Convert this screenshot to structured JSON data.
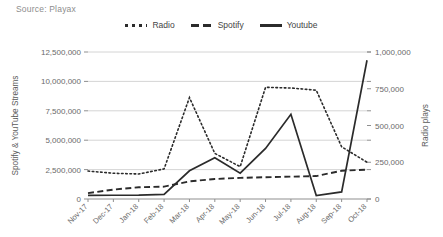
{
  "source_note": "Source: Playax",
  "legend": {
    "items": [
      {
        "label": "Radio",
        "style": "dotted",
        "color": "#2b2b2b",
        "icon": "dotted-line-swatch"
      },
      {
        "label": "Spotify",
        "style": "dashed",
        "color": "#2b2b2b",
        "icon": "dashed-line-swatch"
      },
      {
        "label": "Youtube",
        "style": "solid",
        "color": "#2b2b2b",
        "icon": "solid-line-swatch"
      }
    ]
  },
  "chart_data": {
    "type": "line",
    "title": "",
    "subtitle": "",
    "xlabel": "",
    "ylabel": "Spotify & YouTube Streams",
    "y2label": "Radio plays",
    "grid": true,
    "legend_position": "top-center",
    "categories": [
      "Nov-17",
      "Dec-17",
      "Jan-18",
      "Feb-18",
      "Mar-18",
      "Apr-18",
      "May-18",
      "Jun-18",
      "Jul-18",
      "Aug-18",
      "Sep-18",
      "Oct-18"
    ],
    "ylim": [
      0,
      12500000
    ],
    "yticks": [
      0,
      2500000,
      5000000,
      7500000,
      10000000,
      12500000
    ],
    "ytick_labels": [
      "0",
      "2,500,000",
      "5,000,000",
      "7,500,000",
      "10,000,000",
      "12,500,000"
    ],
    "y2lim": [
      0,
      1000000
    ],
    "y2ticks": [
      0,
      250000,
      500000,
      750000,
      1000000
    ],
    "y2tick_labels": [
      "0",
      "250,000",
      "500,000",
      "750,000",
      "1,000,000"
    ],
    "series": [
      {
        "name": "Radio",
        "axis": "right",
        "style": "dotted",
        "color": "#2b2b2b",
        "values": [
          190000,
          175000,
          170000,
          205000,
          690000,
          310000,
          220000,
          760000,
          755000,
          740000,
          355000,
          250000
        ]
      },
      {
        "name": "Spotify",
        "axis": "left",
        "style": "dashed",
        "color": "#2b2b2b",
        "values": [
          500000,
          800000,
          1000000,
          1050000,
          1500000,
          1700000,
          1800000,
          1850000,
          1900000,
          1950000,
          2400000,
          2500000
        ]
      },
      {
        "name": "Youtube",
        "axis": "left",
        "style": "solid",
        "color": "#2b2b2b",
        "values": [
          300000,
          320000,
          330000,
          400000,
          2400000,
          3500000,
          2200000,
          4300000,
          7200000,
          300000,
          600000,
          11800000
        ]
      }
    ]
  }
}
